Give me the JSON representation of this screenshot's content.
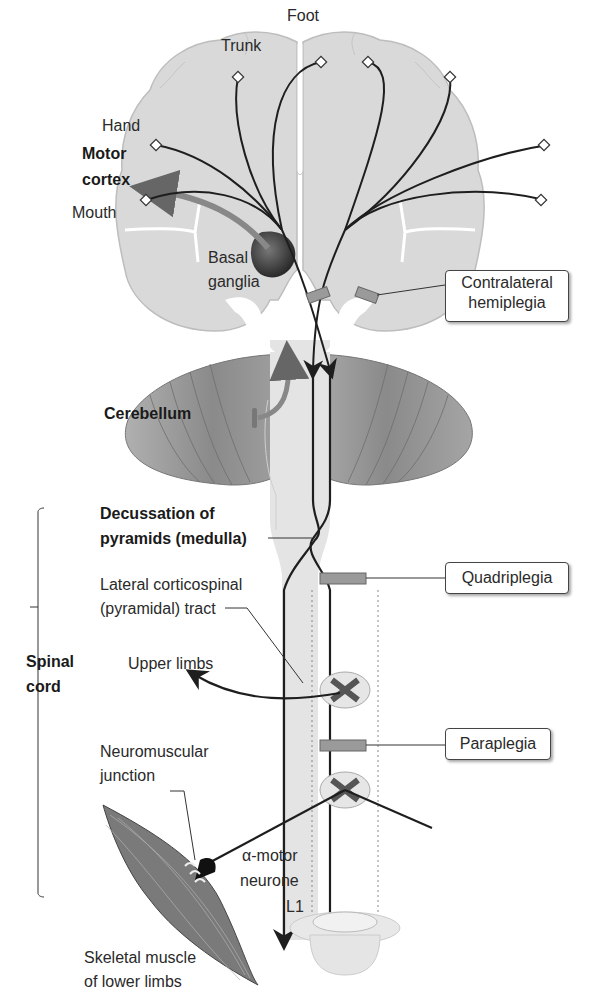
{
  "diagram": {
    "colors": {
      "brain_fill": "#d9d9d9",
      "cerebellum_fill": "#8f8f8f",
      "tract_line": "#1e1e1e",
      "lesion_bar": "#8a8a8a",
      "muscle_fill": "#7a7a7a",
      "background": "#ffffff"
    },
    "cortex_labels": {
      "trunk": "Trunk",
      "foot": "Foot",
      "hand": "Hand",
      "motor_cortex_line1": "Motor",
      "motor_cortex_line2": "cortex",
      "mouth": "Mouth"
    },
    "structures": {
      "basal_ganglia_line1": "Basal",
      "basal_ganglia_line2": "ganglia",
      "cerebellum": "Cerebellum",
      "decussation_line1": "Decussation of",
      "decussation_line2": "pyramids (medulla)",
      "lateral_tract_line1": "Lateral corticospinal",
      "lateral_tract_line2": "(pyramidal) tract",
      "spinal_cord_line1": "Spinal",
      "spinal_cord_line2": "cord",
      "upper_limbs": "Upper limbs",
      "nmj_line1": "Neuromuscular",
      "nmj_line2": "junction",
      "alpha_motor_line1": "α-motor",
      "alpha_motor_line2": "neurone",
      "l1": "L1",
      "muscle_line1": "Skeletal muscle",
      "muscle_line2": "of lower limbs"
    },
    "lesion_boxes": {
      "contralateral_line1": "Contralateral",
      "contralateral_line2": "hemiplegia",
      "quadriplegia": "Quadriplegia",
      "paraplegia": "Paraplegia"
    }
  }
}
